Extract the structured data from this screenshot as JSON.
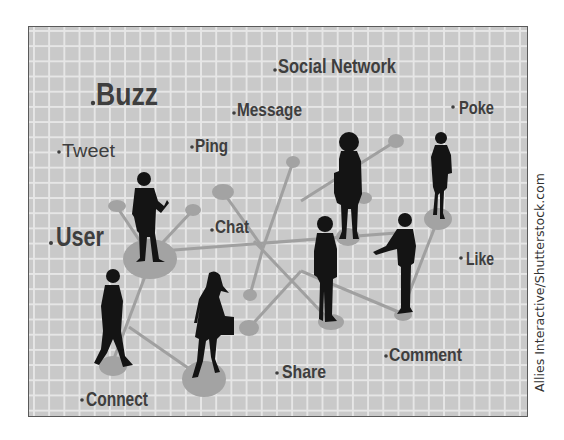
{
  "illustration": {
    "title": "Social network concept illustration",
    "colors": {
      "grid_background": "#c9c9c9",
      "grid_lines": "#e6e6e6",
      "frame_border": "#5a5a5a",
      "node_fill": "#a3a3a3",
      "connector_line": "#a0a0a0",
      "silhouette": "#141414",
      "label_text": "#3e3e3e"
    },
    "labels": {
      "buzz": "Buzz",
      "social_network": "Social Network",
      "message": "Message",
      "poke": "Poke",
      "tweet": "Tweet",
      "ping": "Ping",
      "chat": "Chat",
      "user": "User",
      "like": "Like",
      "comment": "Comment",
      "share": "Share",
      "connect": "Connect"
    },
    "figures": [
      "man-presenting",
      "walking-man",
      "woman-with-handbag",
      "woman-with-folder",
      "standing-woman",
      "man-standing",
      "man-pointing"
    ],
    "credit": "Allies Interactive/Shutterstock.com"
  }
}
